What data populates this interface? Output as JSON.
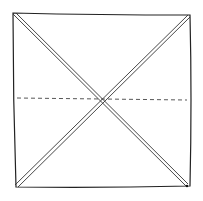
{
  "diagram": {
    "type": "origami-fold-diagram",
    "background": "#ffffff",
    "stroke_color": "#222222",
    "square": {
      "x1": 13,
      "y1": 13,
      "x2": 191,
      "y2": 187
    },
    "diagonal_folds": [
      {
        "from": [
          14,
          14
        ],
        "to": [
          101,
          99
        ],
        "style": "double"
      },
      {
        "from": [
          101,
          99
        ],
        "to": [
          187,
          186
        ],
        "style": "double"
      },
      {
        "from": [
          189,
          16
        ],
        "to": [
          101,
          99
        ],
        "style": "double"
      },
      {
        "from": [
          101,
          99
        ],
        "to": [
          16,
          185
        ],
        "style": "double"
      }
    ],
    "dashed_fold": {
      "from": [
        17,
        98
      ],
      "to": [
        187,
        100
      ],
      "style": "dashed",
      "meaning": "valley-fold"
    }
  }
}
